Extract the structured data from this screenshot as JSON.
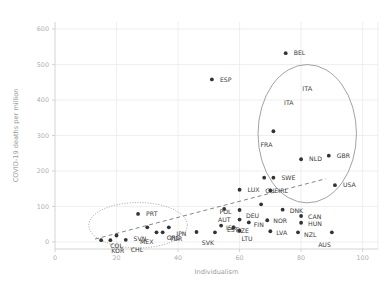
{
  "chart_data": {
    "type": "scatter",
    "title": "",
    "xlabel": "Individualism",
    "ylabel": "COVID-19 deaths per million",
    "xlim": [
      0,
      105
    ],
    "ylim": [
      -20,
      620
    ],
    "xticks": [
      0,
      20,
      40,
      60,
      80,
      100
    ],
    "yticks": [
      0,
      100,
      200,
      300,
      400,
      500,
      600
    ],
    "grid": true,
    "legend": "none",
    "point_color": "#333333",
    "grid_color": "#e8e8e8",
    "axis_color": "#cfcfcf",
    "trendline": {
      "style": "dashed",
      "color": "#777777",
      "x_start": 13,
      "y_start": 8,
      "x_end": 88,
      "y_end": 178
    },
    "annotations": [
      {
        "name": "high-individualism-ellipse",
        "style": "solid",
        "cx": 82,
        "cy": 305,
        "rx": 16,
        "ry": 195,
        "label": "ITA"
      },
      {
        "name": "low-individualism-ellipse",
        "style": "dotted",
        "cx": 27,
        "cy": 47,
        "rx": 16,
        "ry": 64,
        "label": ""
      }
    ],
    "points": [
      {
        "code": "BEL",
        "x": 75,
        "y": 532,
        "lx": 8,
        "ly": 0
      },
      {
        "code": "ESP",
        "x": 51,
        "y": 458,
        "lx": 8,
        "ly": 0
      },
      {
        "code": "ITA",
        "x": 76,
        "y": 392,
        "lx": 0,
        "ly": 0,
        "point_hidden": true
      },
      {
        "code": "FRA",
        "x": 71,
        "y": 312,
        "lx": -1,
        "ly": 14
      },
      {
        "code": "GBR",
        "x": 89,
        "y": 243,
        "lx": 8,
        "ly": 0
      },
      {
        "code": "NLD",
        "x": 80,
        "y": 233,
        "lx": 8,
        "ly": 0
      },
      {
        "code": "USA",
        "x": 91,
        "y": 160,
        "lx": 8,
        "ly": 0
      },
      {
        "code": "CHE",
        "x": 68,
        "y": 181,
        "lx": 1,
        "ly": 13
      },
      {
        "code": "SWE",
        "x": 71,
        "y": 181,
        "lx": 8,
        "ly": 0
      },
      {
        "code": "IRL",
        "x": 70,
        "y": 145,
        "lx": 8,
        "ly": 0
      },
      {
        "code": "LUX",
        "x": 60,
        "y": 147,
        "lx": 8,
        "ly": 0
      },
      {
        "code": "DEU",
        "x": 67,
        "y": 106,
        "lx": -2,
        "ly": 11
      },
      {
        "code": "AUT",
        "x": 55,
        "y": 93,
        "lx": 0,
        "ly": 11
      },
      {
        "code": "POL",
        "x": 60,
        "y": 90,
        "lx": -8,
        "ly": 2
      },
      {
        "code": "DNK",
        "x": 74,
        "y": 91,
        "lx": 7,
        "ly": 1
      },
      {
        "code": "CAN",
        "x": 80,
        "y": 73,
        "lx": 7,
        "ly": 1
      },
      {
        "code": "NOR",
        "x": 69,
        "y": 61,
        "lx": 6,
        "ly": 1
      },
      {
        "code": "HUN",
        "x": 80,
        "y": 54,
        "lx": 7,
        "ly": 1
      },
      {
        "code": "EST",
        "x": 60,
        "y": 63,
        "lx": -1,
        "ly": 10
      },
      {
        "code": "FIN",
        "x": 63,
        "y": 55,
        "lx": 5,
        "ly": 2
      },
      {
        "code": "ISR",
        "x": 54,
        "y": 46,
        "lx": 5,
        "ly": 2
      },
      {
        "code": "CZE",
        "x": 58,
        "y": 40,
        "lx": 3,
        "ly": 3
      },
      {
        "code": "LTU",
        "x": 60,
        "y": 32,
        "lx": 2,
        "ly": 8
      },
      {
        "code": "LVA",
        "x": 70,
        "y": 30,
        "lx": 6,
        "ly": 2
      },
      {
        "code": "NZL",
        "x": 79,
        "y": 27,
        "lx": 6,
        "ly": 2
      },
      {
        "code": "AUS",
        "x": 90,
        "y": 27,
        "lx": -1,
        "ly": 12
      },
      {
        "code": "SVK",
        "x": 52,
        "y": 27,
        "lx": -1,
        "ly": 10
      },
      {
        "code": "JPN",
        "x": 46,
        "y": 28,
        "lx": -10,
        "ly": 2
      },
      {
        "code": "PRT",
        "x": 27,
        "y": 79,
        "lx": 8,
        "ly": 0
      },
      {
        "code": "TUR",
        "x": 37,
        "y": 41,
        "lx": 1,
        "ly": 11
      },
      {
        "code": "SVN",
        "x": 30,
        "y": 41,
        "lx": -1,
        "ly": 11
      },
      {
        "code": "MEX",
        "x": 33,
        "y": 27,
        "lx": -3,
        "ly": 9
      },
      {
        "code": "GRC",
        "x": 35,
        "y": 27,
        "lx": 4,
        "ly": 5
      },
      {
        "code": "COL",
        "x": 20,
        "y": 18,
        "lx": 0,
        "ly": 10
      },
      {
        "code": "KOR",
        "x": 18,
        "y": 5,
        "lx": 1,
        "ly": 11
      },
      {
        "code": "CHL",
        "x": 23,
        "y": 6,
        "lx": 5,
        "ly": 10
      },
      {
        "code": "CRI",
        "x": 15,
        "y": 5,
        "lx": 0,
        "ly": 0,
        "label_hidden": true
      }
    ]
  }
}
